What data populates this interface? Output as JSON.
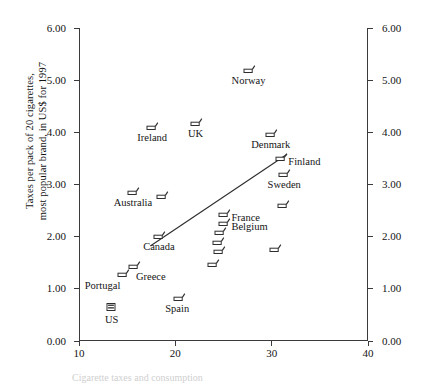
{
  "chart_data": {
    "type": "scatter",
    "title": "",
    "xlabel": "",
    "ylabel": "Taxes per pack of 20 cigarettes,\nmost popular brand, in US$ for 1997",
    "xlim": [
      10,
      40
    ],
    "ylim": [
      0.0,
      6.0
    ],
    "xticks": [
      "10",
      "20",
      "30",
      "40"
    ],
    "xtick_values": [
      10,
      20,
      30,
      40
    ],
    "yticks": [
      "0.00",
      "1.00",
      "2.00",
      "3.00",
      "4.00",
      "5.00",
      "6.00"
    ],
    "ytick_values": [
      0.0,
      1.0,
      2.0,
      3.0,
      4.0,
      5.0,
      6.0
    ],
    "yticks_right": [
      "0.00",
      "1.00",
      "2.00",
      "3.00",
      "4.00",
      "5.00",
      "6.00"
    ],
    "grid": false,
    "legend": "none",
    "marker_style": "cigarette-glyph",
    "points": [
      {
        "name": "Norway",
        "x": 27.6,
        "y": 5.22,
        "label_dx": 0,
        "label_dy": 11,
        "label_anchor": "middle"
      },
      {
        "name": "Ireland",
        "x": 17.6,
        "y": 4.12,
        "label_dx": 0,
        "label_dy": 11,
        "label_anchor": "middle"
      },
      {
        "name": "UK",
        "x": 22.1,
        "y": 4.2,
        "label_dx": 0,
        "label_dy": 11,
        "label_anchor": "middle"
      },
      {
        "name": "Denmark",
        "x": 29.9,
        "y": 3.98,
        "label_dx": 0,
        "label_dy": 11,
        "label_anchor": "middle"
      },
      {
        "name": "Finland",
        "x": 31.0,
        "y": 3.52,
        "label_dx": 7,
        "label_dy": 4,
        "label_anchor": "start"
      },
      {
        "name": "Sweden",
        "x": 31.3,
        "y": 3.22,
        "label_dx": 0,
        "label_dy": 11,
        "label_anchor": "middle"
      },
      {
        "name": "Australia",
        "x": 15.6,
        "y": 2.88,
        "label_dx": 0,
        "label_dy": 11,
        "label_anchor": "middle"
      },
      {
        "name": "",
        "x": 18.6,
        "y": 2.8,
        "label_dx": 0,
        "label_dy": 0,
        "label_anchor": "middle"
      },
      {
        "name": "France",
        "x": 25.1,
        "y": 2.46,
        "label_dx": 7,
        "label_dy": 4,
        "label_anchor": "start"
      },
      {
        "name": "Belgium",
        "x": 25.1,
        "y": 2.28,
        "label_dx": 7,
        "label_dy": 4,
        "label_anchor": "start"
      },
      {
        "name": "",
        "x": 24.6,
        "y": 2.1,
        "label_dx": 0,
        "label_dy": 0,
        "label_anchor": "middle"
      },
      {
        "name": "",
        "x": 24.4,
        "y": 1.92,
        "label_dx": 0,
        "label_dy": 0,
        "label_anchor": "middle"
      },
      {
        "name": "",
        "x": 24.5,
        "y": 1.74,
        "label_dx": 0,
        "label_dy": 0,
        "label_anchor": "middle"
      },
      {
        "name": "",
        "x": 23.9,
        "y": 1.5,
        "label_dx": 0,
        "label_dy": 0,
        "label_anchor": "middle"
      },
      {
        "name": "",
        "x": 31.2,
        "y": 2.62,
        "label_dx": 0,
        "label_dy": 0,
        "label_anchor": "middle"
      },
      {
        "name": "",
        "x": 30.3,
        "y": 1.78,
        "label_dx": 0,
        "label_dy": 0,
        "label_anchor": "middle"
      },
      {
        "name": "Canada",
        "x": 18.3,
        "y": 2.03,
        "label_dx": 0,
        "label_dy": 11,
        "label_anchor": "middle"
      },
      {
        "name": "Greece",
        "x": 15.7,
        "y": 1.45,
        "label_dx": 2,
        "label_dy": 11,
        "label_anchor": "start"
      },
      {
        "name": "Portugal",
        "x": 14.6,
        "y": 1.3,
        "label_dx": -3,
        "label_dy": 12,
        "label_anchor": "end"
      },
      {
        "name": "Spain",
        "x": 20.4,
        "y": 0.84,
        "label_dx": -2,
        "label_dy": 11,
        "label_anchor": "middle"
      },
      {
        "name": "US",
        "x": 13.4,
        "y": 0.66,
        "label_dx": 0,
        "label_dy": 12,
        "label_anchor": "middle"
      }
    ],
    "trend_line": {
      "x0": 17.4,
      "y0": 1.82,
      "x1": 31.6,
      "y1": 3.58
    }
  },
  "caption": {
    "text": "Cigarette taxes and consumption"
  }
}
